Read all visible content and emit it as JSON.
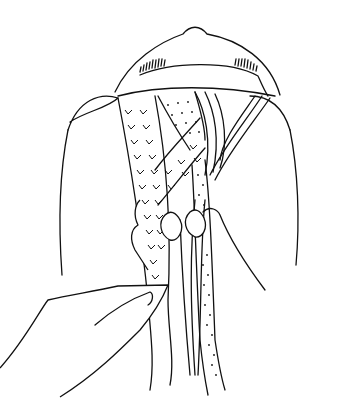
{
  "illustration": {
    "subject": "Hands braiding hair into a three-strand braid, viewed from behind the head",
    "style": "black line drawing on white",
    "strand_patterns": [
      "chevron",
      "dotted",
      "striped"
    ],
    "colors": {
      "line": "#111111",
      "background": "#ffffff"
    }
  }
}
